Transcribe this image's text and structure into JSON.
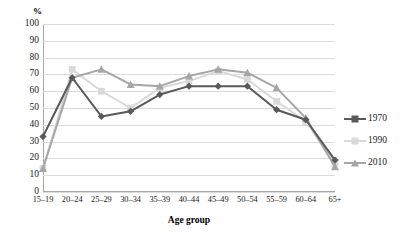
{
  "chart_data": {
    "type": "line",
    "title": "",
    "xlabel": "Age group",
    "ylabel": "%",
    "ylim": [
      0,
      100
    ],
    "ystep": 10,
    "grid": true,
    "legend_position": "right",
    "categories": [
      "15–19",
      "20–24",
      "25–29",
      "30–34",
      "35–39",
      "40–44",
      "45–49",
      "50–54",
      "55–59",
      "60–64",
      "65+"
    ],
    "ytick_labels": [
      "100",
      "90",
      "80",
      "70",
      "60",
      "50",
      "40",
      "30",
      "20",
      "10",
      "0"
    ],
    "series": [
      {
        "name": "1970",
        "color": "#595959",
        "marker": "diamond",
        "values": [
          33,
          68,
          45,
          48,
          58,
          63,
          63,
          63,
          49,
          43,
          19
        ]
      },
      {
        "name": "1990",
        "color": "#d9d9d9",
        "marker": "square",
        "values": [
          14,
          73,
          60,
          50,
          62,
          66,
          72,
          67,
          54,
          42,
          17
        ]
      },
      {
        "name": "2010",
        "color": "#a6a6a6",
        "marker": "triangle",
        "values": [
          14,
          68,
          73,
          64,
          63,
          69,
          73,
          71,
          62,
          44,
          15
        ]
      }
    ]
  },
  "axes": {
    "y_title": "%",
    "x_title": "Age group"
  },
  "legend": {
    "entries": [
      {
        "label": "1970"
      },
      {
        "label": "1990"
      },
      {
        "label": "2010"
      }
    ]
  },
  "colors": {
    "series_1970": "#595959",
    "series_1990": "#d9d9d9",
    "series_2010": "#a6a6a6",
    "gridline": "#dcdcdc",
    "axis": "#a6a6a6",
    "text": "#1a1a1a",
    "background": "#ffffff"
  }
}
